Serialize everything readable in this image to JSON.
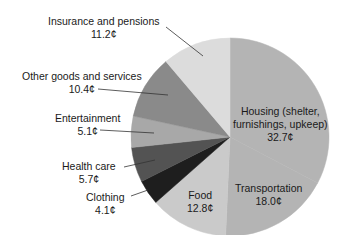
{
  "chart_data": {
    "type": "pie",
    "title": "",
    "unit": "¢",
    "start_angle_deg": 0,
    "direction": "clockwise",
    "center": [
      230,
      137
    ],
    "radius": 99,
    "slices": [
      {
        "label": "Housing (shelter, furnishings, upkeep)",
        "value": 32.7,
        "display": "32.7¢",
        "color": "#b4b4b4"
      },
      {
        "label": "Transportation",
        "value": 18.0,
        "display": "18.0¢",
        "color": "#b4b4b4"
      },
      {
        "label": "Food",
        "value": 12.8,
        "display": "12.8¢",
        "color": "#cacaca"
      },
      {
        "label": "Clothing",
        "value": 4.1,
        "display": "4.1¢",
        "color": "#1e1e1e"
      },
      {
        "label": "Health care",
        "value": 5.7,
        "display": "5.7¢",
        "color": "#535353"
      },
      {
        "label": "Entertainment",
        "value": 5.1,
        "display": "5.1¢",
        "color": "#a8a8a8"
      },
      {
        "label": "Other goods and services",
        "value": 10.4,
        "display": "10.4¢",
        "color": "#8a8a8a"
      },
      {
        "label": "Insurance and pensions",
        "value": 11.2,
        "display": "11.2¢",
        "color": "#dcdcdc"
      }
    ],
    "categories": [
      "Housing (shelter, furnishings, upkeep)",
      "Transportation",
      "Food",
      "Clothing",
      "Health care",
      "Entertainment",
      "Other goods and services",
      "Insurance and pensions"
    ],
    "values": [
      32.7,
      18.0,
      12.8,
      4.1,
      5.7,
      5.1,
      10.4,
      11.2
    ]
  },
  "labels": {
    "housing": {
      "line1": "Housing (shelter,",
      "line2": "furnishings, upkeep)",
      "value": "32.7¢"
    },
    "transportation": {
      "line1": "Transportation",
      "value": "18.0¢"
    },
    "food": {
      "line1": "Food",
      "value": "12.8¢"
    },
    "clothing": {
      "line1": "Clothing",
      "value": "4.1¢"
    },
    "health": {
      "line1": "Health care",
      "value": "5.7¢"
    },
    "entertainment": {
      "line1": "Entertainment",
      "value": "5.1¢"
    },
    "other": {
      "line1": "Other goods and services",
      "value": "10.4¢"
    },
    "insurance": {
      "line1": "Insurance and pensions",
      "value": "11.2¢"
    }
  }
}
